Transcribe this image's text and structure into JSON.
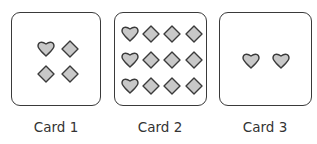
{
  "colors": {
    "card_border": "#3a3a3a",
    "shape_fill": "#c8c8c8",
    "shape_stroke": "#3a3a3a",
    "label": "#333333"
  },
  "cards": [
    {
      "label": "Card 1",
      "shapes": [
        {
          "type": "heart-icon",
          "x": 34,
          "y": 36
        },
        {
          "type": "diamond-icon",
          "x": 58,
          "y": 36
        },
        {
          "type": "diamond-icon",
          "x": 34,
          "y": 61
        },
        {
          "type": "diamond-icon",
          "x": 58,
          "y": 61
        }
      ]
    },
    {
      "label": "Card 2",
      "shapes": [
        {
          "type": "heart-icon",
          "x": 15,
          "y": 21
        },
        {
          "type": "diamond-icon",
          "x": 36,
          "y": 21
        },
        {
          "type": "diamond-icon",
          "x": 57,
          "y": 21
        },
        {
          "type": "diamond-icon",
          "x": 79,
          "y": 21
        },
        {
          "type": "heart-icon",
          "x": 15,
          "y": 47
        },
        {
          "type": "diamond-icon",
          "x": 36,
          "y": 47
        },
        {
          "type": "diamond-icon",
          "x": 57,
          "y": 47
        },
        {
          "type": "diamond-icon",
          "x": 79,
          "y": 47
        },
        {
          "type": "heart-icon",
          "x": 15,
          "y": 73
        },
        {
          "type": "diamond-icon",
          "x": 36,
          "y": 73
        },
        {
          "type": "diamond-icon",
          "x": 57,
          "y": 73
        },
        {
          "type": "diamond-icon",
          "x": 79,
          "y": 73
        }
      ]
    },
    {
      "label": "Card 3",
      "shapes": [
        {
          "type": "heart-icon",
          "x": 31,
          "y": 48
        },
        {
          "type": "heart-icon",
          "x": 61,
          "y": 48
        }
      ]
    }
  ]
}
